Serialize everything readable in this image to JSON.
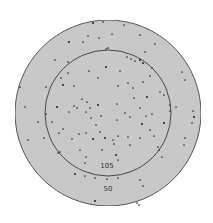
{
  "diagram": {
    "type": "concentric-circle-dot-distribution",
    "colors": {
      "background": "#ffffff",
      "fill": "#c9c9c9",
      "stroke": "#4a4a4a",
      "dot": "#2e2e2e",
      "label": "#333333"
    },
    "outer_circle": {
      "cx": 108,
      "cy": 113,
      "r": 93,
      "label": "50",
      "label_x": 108,
      "label_y": 191
    },
    "inner_circle": {
      "cx": 108,
      "cy": 113,
      "r": 63,
      "label": "105",
      "label_x": 107,
      "label_y": 168
    },
    "dots": [
      [
        93,
        23
      ],
      [
        103,
        22
      ],
      [
        124,
        25
      ],
      [
        112,
        34
      ],
      [
        88,
        36
      ],
      [
        99,
        38
      ],
      [
        83,
        42
      ],
      [
        69,
        42
      ],
      [
        140,
        35
      ],
      [
        155,
        44
      ],
      [
        106,
        49
      ],
      [
        127,
        57
      ],
      [
        131,
        59
      ],
      [
        135,
        61
      ],
      [
        140,
        60
      ],
      [
        145,
        52
      ],
      [
        152,
        68
      ],
      [
        182,
        72
      ],
      [
        185,
        80
      ],
      [
        68,
        73
      ],
      [
        61,
        78
      ],
      [
        63,
        85
      ],
      [
        46,
        87
      ],
      [
        25,
        107
      ],
      [
        20,
        87
      ],
      [
        74,
        86
      ],
      [
        89,
        71
      ],
      [
        98,
        78
      ],
      [
        106,
        67
      ],
      [
        120,
        71
      ],
      [
        118,
        86
      ],
      [
        128,
        83
      ],
      [
        143,
        82
      ],
      [
        150,
        76
      ],
      [
        133,
        88
      ],
      [
        147,
        97
      ],
      [
        160,
        92
      ],
      [
        164,
        95
      ],
      [
        170,
        105
      ],
      [
        170,
        111
      ],
      [
        176,
        107
      ],
      [
        193,
        111
      ],
      [
        194,
        117
      ],
      [
        192,
        123
      ],
      [
        185,
        138
      ],
      [
        184,
        145
      ],
      [
        159,
        150
      ],
      [
        162,
        157
      ],
      [
        150,
        130
      ],
      [
        142,
        124
      ],
      [
        146,
        116
      ],
      [
        130,
        117
      ],
      [
        125,
        113
      ],
      [
        117,
        120
      ],
      [
        118,
        136
      ],
      [
        113,
        140
      ],
      [
        105,
        138
      ],
      [
        114,
        144
      ],
      [
        100,
        132
      ],
      [
        96,
        125
      ],
      [
        91,
        118
      ],
      [
        90,
        108
      ],
      [
        86,
        112
      ],
      [
        98,
        105
      ],
      [
        101,
        116
      ],
      [
        87,
        102
      ],
      [
        82,
        99
      ],
      [
        77,
        108
      ],
      [
        74,
        106
      ],
      [
        69,
        112
      ],
      [
        57,
        107
      ],
      [
        52,
        122
      ],
      [
        59,
        133
      ],
      [
        63,
        129
      ],
      [
        72,
        139
      ],
      [
        79,
        134
      ],
      [
        86,
        133
      ],
      [
        93,
        139
      ],
      [
        60,
        152
      ],
      [
        58,
        153
      ],
      [
        80,
        150
      ],
      [
        86,
        157
      ],
      [
        85,
        163
      ],
      [
        102,
        150
      ],
      [
        116,
        155
      ],
      [
        118,
        160
      ],
      [
        128,
        137
      ],
      [
        130,
        145
      ],
      [
        140,
        138
      ],
      [
        154,
        136
      ],
      [
        158,
        147
      ],
      [
        75,
        174
      ],
      [
        85,
        176
      ],
      [
        95,
        178
      ],
      [
        107,
        179
      ],
      [
        118,
        178
      ],
      [
        140,
        180
      ],
      [
        143,
        186
      ],
      [
        95,
        201
      ],
      [
        137,
        203
      ],
      [
        139,
        205
      ],
      [
        44,
        138
      ],
      [
        28,
        140
      ],
      [
        38,
        122
      ],
      [
        46,
        114
      ],
      [
        143,
        63
      ],
      [
        108,
        48
      ],
      [
        68,
        62
      ],
      [
        55,
        60
      ],
      [
        117,
        104
      ],
      [
        140,
        108
      ],
      [
        152,
        114
      ],
      [
        164,
        123
      ],
      [
        134,
        98
      ]
    ]
  }
}
